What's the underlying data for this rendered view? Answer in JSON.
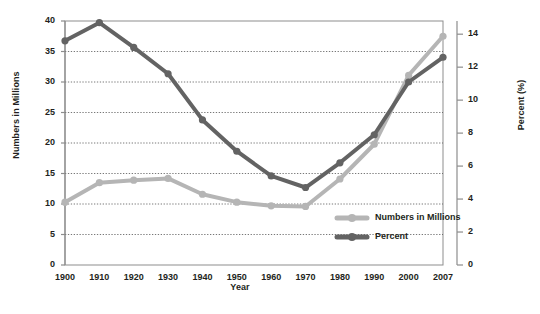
{
  "chart_data": {
    "type": "line",
    "title": "",
    "xlabel": "Year",
    "ylabel": "Numbers in Millions",
    "y2label": "Percent (%)",
    "grid": true,
    "legend_position": "inside-bottom-right",
    "categories": [
      "1900",
      "1910",
      "1920",
      "1930",
      "1940",
      "1950",
      "1960",
      "1970",
      "1980",
      "1990",
      "2000",
      "2007"
    ],
    "x": [
      1900,
      1910,
      1920,
      1930,
      1940,
      1950,
      1960,
      1970,
      1980,
      1990,
      2000,
      2007
    ],
    "ylim": [
      0,
      40
    ],
    "yticks": [
      0,
      5,
      10,
      15,
      20,
      25,
      30,
      35,
      40
    ],
    "y2lim": [
      0,
      14.8
    ],
    "y2ticks": [
      0,
      2,
      4,
      6,
      8,
      10,
      12,
      14
    ],
    "series": [
      {
        "name": "Numbers in Millions",
        "axis": "left",
        "color": "#b5b5b5",
        "values": [
          10.3,
          13.5,
          13.9,
          14.2,
          11.6,
          10.3,
          9.7,
          9.6,
          14.1,
          19.8,
          31.1,
          37.5
        ]
      },
      {
        "name": "Percent",
        "axis": "right",
        "color": "#636363",
        "values": [
          13.6,
          14.7,
          13.2,
          11.6,
          8.8,
          6.9,
          5.4,
          4.7,
          6.2,
          7.9,
          11.1,
          12.6
        ]
      }
    ]
  },
  "legend": {
    "items": [
      {
        "label": "Numbers in Millions",
        "color": "#b5b5b5"
      },
      {
        "label": "Percent",
        "color": "#636363"
      }
    ]
  },
  "axis": {
    "left_title": "Numbers in Millions",
    "right_title": "Percent (%)",
    "x_title": "Year"
  }
}
